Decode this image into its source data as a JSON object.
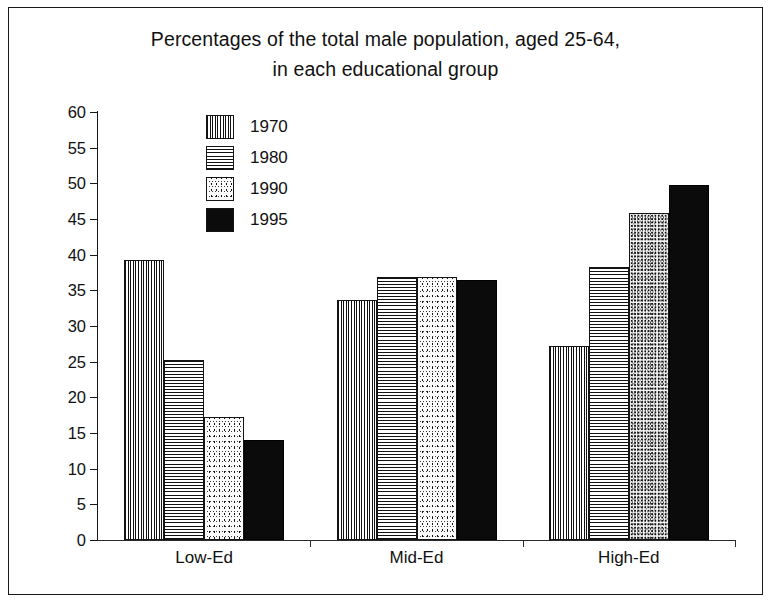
{
  "figure": {
    "title_line1": "Percentages of the total male population, aged 25-64,",
    "title_line2": "in each educational group"
  },
  "chart_data": {
    "type": "bar",
    "title": "Percentages of the total male population, aged 25-64, in each educational group",
    "xlabel": "",
    "ylabel": "",
    "ylim": [
      0,
      60
    ],
    "ytick_step": 5,
    "yticks": [
      0,
      5,
      10,
      15,
      20,
      25,
      30,
      35,
      40,
      45,
      50,
      55,
      60
    ],
    "grid": false,
    "legend_position": "inside-top-left",
    "categories": [
      "Low-Ed",
      "Mid-Ed",
      "High-Ed"
    ],
    "series": [
      {
        "name": "1970",
        "pattern": "vertical-stripes",
        "values": [
          39.3,
          33.7,
          27.2
        ]
      },
      {
        "name": "1980",
        "pattern": "horizontal-stripes",
        "values": [
          25.2,
          36.8,
          38.3
        ]
      },
      {
        "name": "1990",
        "pattern": "speckle",
        "values": [
          17.3,
          36.9,
          45.8
        ]
      },
      {
        "name": "1995",
        "pattern": "solid-black",
        "values": [
          14.0,
          36.4,
          49.7
        ]
      }
    ]
  },
  "legend": {
    "items": [
      {
        "label": "1970"
      },
      {
        "label": "1980"
      },
      {
        "label": "1990"
      },
      {
        "label": "1995"
      }
    ]
  },
  "axis": {
    "y_labels": [
      "60",
      "55",
      "50",
      "45",
      "40",
      "35",
      "30",
      "25",
      "20",
      "15",
      "10",
      "5",
      "0"
    ]
  }
}
